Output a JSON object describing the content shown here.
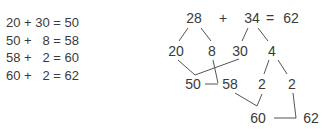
{
  "equations": [
    "20 + 30 = 50",
    "50 +   8 = 58",
    "58 +   2 = 60",
    "60 +   2 = 62"
  ],
  "tree": {
    "top": {
      "a": "28",
      "plus": "+",
      "b": "34",
      "eq": "=",
      "result": "62"
    },
    "split_a": [
      "20",
      "8"
    ],
    "split_b": [
      "30",
      "4"
    ],
    "split_4": [
      "2",
      "2"
    ],
    "sums": {
      "s1": "50",
      "s2": "58",
      "s3": "60",
      "s4": "62"
    }
  }
}
